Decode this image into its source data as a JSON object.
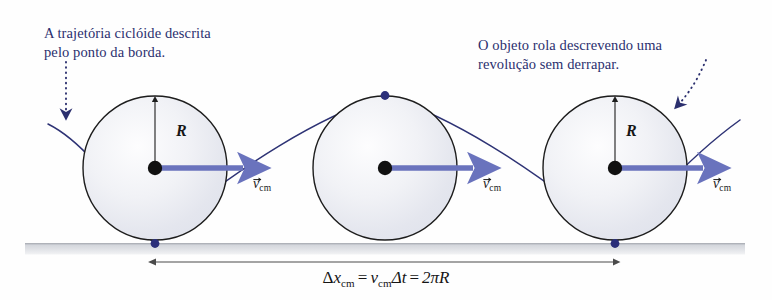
{
  "figure": {
    "background_color": "#fefefe"
  },
  "annotations": {
    "cycloid_note": "A trajetória ciclóide descrita\npelo ponto da borda.",
    "revolution_note": "O objeto rola descrevendo uma\nrevolução sem derrapar.",
    "text_color": "#2b2f6e"
  },
  "labels": {
    "radius": "R",
    "velocity_symbol": "v",
    "velocity_subscript": "cm",
    "velocity_vector_arrow": "→"
  },
  "equation": {
    "delta": "Δ",
    "x_symbol": "x",
    "x_subscript": "cm",
    "equals": "=",
    "v_symbol": "v",
    "v_subscript": "cm",
    "delta_t": "Δt",
    "equals2": "=",
    "result": "2πR",
    "full_text": "Δx_cm = v_cm Δt = 2πR"
  },
  "colors": {
    "cycloid_curve": "#2e3375",
    "velocity_arrow": "#6a73bd",
    "circle_outline": "#1d1d1d",
    "center_dot": "#111111",
    "rim_dot": "#2b2f7a",
    "ground": "#d6d8dc",
    "dimension_line": "#4a4a4a",
    "dotted_pointer": "#2b2f6e"
  },
  "geometry": {
    "circle_radius_px": 72,
    "circle_centers_x": [
      155,
      385,
      615
    ],
    "circle_center_y": 168,
    "ground_y": 244,
    "dimension_line_y": 262,
    "dimension_start_x": 156,
    "dimension_end_x": 614
  },
  "icons": {
    "pointer_left": "dotted-arrow-down-icon",
    "pointer_right": "dotted-arrow-curve-icon",
    "velocity": "right-arrow-icon",
    "radius": "up-arrow-icon"
  }
}
